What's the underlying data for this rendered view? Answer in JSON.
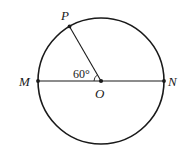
{
  "diagram": {
    "type": "geometry-circle",
    "circle": {
      "center_label": "O",
      "cx": 101,
      "cy": 81,
      "r": 63
    },
    "points": {
      "P": {
        "label": "P",
        "x": 69.5,
        "y": 26.4
      },
      "M": {
        "label": "M",
        "x": 38,
        "y": 81
      },
      "N": {
        "label": "N",
        "x": 164,
        "y": 81
      },
      "O": {
        "label": "O",
        "x": 101,
        "y": 81
      }
    },
    "segments": [
      {
        "from": "M",
        "to": "N",
        "name": "diameter-MN"
      },
      {
        "from": "O",
        "to": "P",
        "name": "radius-OP"
      }
    ],
    "angle": {
      "label": "60°",
      "vertex": "O",
      "between": [
        "P",
        "M"
      ],
      "degrees": 60
    },
    "colors": {
      "stroke": "#1a1a1a",
      "background": "#ffffff"
    }
  }
}
